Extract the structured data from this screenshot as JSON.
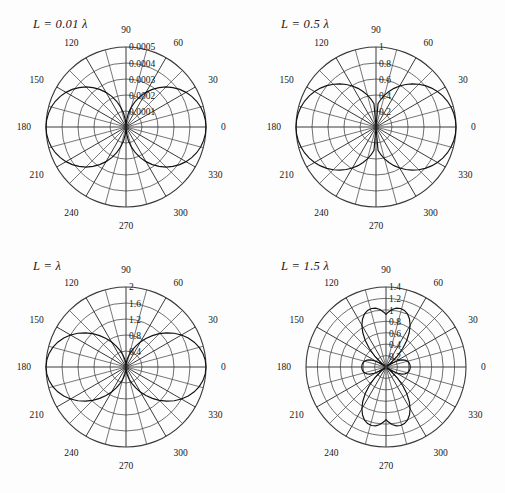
{
  "figure": {
    "background_color": "#fdfdfd",
    "line_color": "#3a3a3a",
    "pattern_color": "#111111"
  },
  "chart_data": [
    {
      "type": "line",
      "plot_style": "polar",
      "title": "L = 0.01 λ",
      "title_parts": {
        "symbol": "L",
        "equals": "=",
        "value": "0.01",
        "unit": "λ"
      },
      "xlabel": "",
      "ylabel": "",
      "grid": true,
      "legend": "none",
      "angle_unit": "degrees",
      "angle_ticks": [
        0,
        30,
        60,
        90,
        120,
        150,
        180,
        210,
        240,
        270,
        300,
        330
      ],
      "angle_tick_labels": [
        "0",
        "30",
        "60",
        "90",
        "120",
        "150",
        "180",
        "210",
        "240",
        "270",
        "300",
        "330"
      ],
      "angle_minor_step": 15,
      "radial_ticks": [
        0.0001,
        0.0002,
        0.0003,
        0.0004,
        0.0005
      ],
      "radial_tick_labels": [
        "0.0001",
        "0.0002",
        "0.0003",
        "0.0004",
        "0.0005"
      ],
      "rlim": [
        0,
        0.0005
      ],
      "series": [
        {
          "name": "|E| pattern",
          "description": "Figure-eight dipole pattern, maxima along 0 and 180 degrees",
          "theta": [
            0,
            5,
            10,
            15,
            20,
            25,
            30,
            35,
            40,
            45,
            50,
            55,
            60,
            65,
            70,
            75,
            80,
            85,
            90,
            95,
            100,
            105,
            110,
            115,
            120,
            125,
            130,
            135,
            140,
            145,
            150,
            155,
            160,
            165,
            170,
            175,
            180,
            185,
            190,
            195,
            200,
            205,
            210,
            215,
            220,
            225,
            230,
            235,
            240,
            245,
            250,
            255,
            260,
            265,
            270,
            275,
            280,
            285,
            290,
            295,
            300,
            305,
            310,
            315,
            320,
            325,
            330,
            335,
            340,
            345,
            350,
            355,
            360
          ],
          "r": [
            0.0005,
            0.000498,
            0.000492,
            0.000483,
            0.00047,
            0.000453,
            0.000433,
            0.00041,
            0.000383,
            0.000354,
            0.000321,
            0.000287,
            0.00025,
            0.000211,
            0.000171,
            0.000129,
            8.68e-05,
            4.35e-05,
            0.0,
            4.35e-05,
            8.68e-05,
            0.000129,
            0.000171,
            0.000211,
            0.00025,
            0.000287,
            0.000321,
            0.000354,
            0.000383,
            0.00041,
            0.000433,
            0.000453,
            0.00047,
            0.000483,
            0.000492,
            0.000498,
            0.0005,
            0.000498,
            0.000492,
            0.000483,
            0.00047,
            0.000453,
            0.000433,
            0.00041,
            0.000383,
            0.000354,
            0.000321,
            0.000287,
            0.00025,
            0.000211,
            0.000171,
            0.000129,
            8.68e-05,
            4.35e-05,
            0.0,
            4.35e-05,
            8.68e-05,
            0.000129,
            0.000171,
            0.000211,
            0.00025,
            0.000287,
            0.000321,
            0.000354,
            0.000383,
            0.00041,
            0.000433,
            0.000453,
            0.00047,
            0.000483,
            0.000492,
            0.000498,
            0.0005
          ]
        }
      ]
    },
    {
      "type": "line",
      "plot_style": "polar",
      "title": "L = 0.5 λ",
      "title_parts": {
        "symbol": "L",
        "equals": "=",
        "value": "0.5",
        "unit": "λ"
      },
      "xlabel": "",
      "ylabel": "",
      "grid": true,
      "legend": "none",
      "angle_unit": "degrees",
      "angle_ticks": [
        0,
        30,
        60,
        90,
        120,
        150,
        180,
        210,
        240,
        270,
        300,
        330
      ],
      "angle_tick_labels": [
        "0",
        "30",
        "60",
        "90",
        "120",
        "150",
        "180",
        "210",
        "240",
        "270",
        "300",
        "330"
      ],
      "angle_minor_step": 15,
      "radial_ticks": [
        0.2,
        0.4,
        0.6,
        0.8,
        1
      ],
      "radial_tick_labels": [
        "0.2",
        "0.4",
        "0.6",
        "0.8",
        "1"
      ],
      "rlim": [
        0,
        1
      ],
      "series": [
        {
          "name": "|E| pattern",
          "description": "Half-wave dipole figure-eight, maxima along 0 and 180 degrees",
          "theta": [
            0,
            5,
            10,
            15,
            20,
            25,
            30,
            35,
            40,
            45,
            50,
            55,
            60,
            65,
            70,
            75,
            80,
            85,
            90,
            95,
            100,
            105,
            110,
            115,
            120,
            125,
            130,
            135,
            140,
            145,
            150,
            155,
            160,
            165,
            170,
            175,
            180,
            185,
            190,
            195,
            200,
            205,
            210,
            215,
            220,
            225,
            230,
            235,
            240,
            245,
            250,
            255,
            260,
            265,
            270,
            275,
            280,
            285,
            290,
            295,
            300,
            305,
            310,
            315,
            320,
            325,
            330,
            335,
            340,
            345,
            350,
            355,
            360
          ],
          "r": [
            1.0,
            0.9967,
            0.987,
            0.9709,
            0.9486,
            0.9204,
            0.8866,
            0.8476,
            0.8038,
            0.7558,
            0.7041,
            0.6493,
            0.5921,
            0.5331,
            0.4729,
            0.4122,
            0.3516,
            0.2917,
            0.0,
            0.2917,
            0.3516,
            0.4122,
            0.4729,
            0.5331,
            0.5921,
            0.6493,
            0.7041,
            0.7558,
            0.8038,
            0.8476,
            0.8866,
            0.9204,
            0.9486,
            0.9709,
            0.987,
            0.9967,
            1.0,
            0.9967,
            0.987,
            0.9709,
            0.9486,
            0.9204,
            0.8866,
            0.8476,
            0.8038,
            0.7558,
            0.7041,
            0.6493,
            0.5921,
            0.5331,
            0.4729,
            0.4122,
            0.3516,
            0.2917,
            0.0,
            0.2917,
            0.3516,
            0.4122,
            0.4729,
            0.5331,
            0.5921,
            0.6493,
            0.7041,
            0.7558,
            0.8038,
            0.8476,
            0.8866,
            0.9204,
            0.9486,
            0.9709,
            0.987,
            0.9967,
            1.0
          ]
        }
      ]
    },
    {
      "type": "line",
      "plot_style": "polar",
      "title": "L = λ",
      "title_parts": {
        "symbol": "L",
        "equals": "=",
        "value": "",
        "unit": "λ"
      },
      "xlabel": "",
      "ylabel": "",
      "grid": true,
      "legend": "none",
      "angle_unit": "degrees",
      "angle_ticks": [
        0,
        30,
        60,
        90,
        120,
        150,
        180,
        210,
        240,
        270,
        300,
        330
      ],
      "angle_tick_labels": [
        "0",
        "30",
        "60",
        "90",
        "120",
        "150",
        "180",
        "210",
        "240",
        "270",
        "300",
        "330"
      ],
      "angle_minor_step": 15,
      "radial_ticks": [
        0.4,
        0.8,
        1.2,
        1.6,
        2
      ],
      "radial_tick_labels": [
        "0.4",
        "0.8",
        "1.2",
        "1.6",
        "2"
      ],
      "rlim": [
        0,
        2
      ],
      "series": [
        {
          "name": "|E| pattern",
          "description": "Full-wave dipole, broad figure-eight with peak 2.0 along 0 and 180 degrees",
          "theta": [
            0,
            5,
            10,
            15,
            20,
            25,
            30,
            35,
            40,
            45,
            50,
            55,
            60,
            65,
            70,
            75,
            80,
            85,
            90,
            95,
            100,
            105,
            110,
            115,
            120,
            125,
            130,
            135,
            140,
            145,
            150,
            155,
            160,
            165,
            170,
            175,
            180,
            185,
            190,
            195,
            200,
            205,
            210,
            215,
            220,
            225,
            230,
            235,
            240,
            245,
            250,
            255,
            260,
            265,
            270,
            275,
            280,
            285,
            290,
            295,
            300,
            305,
            310,
            315,
            320,
            325,
            330,
            335,
            340,
            345,
            350,
            355,
            360
          ],
          "r": [
            2.0,
            1.988,
            1.953,
            1.895,
            1.816,
            1.717,
            1.601,
            1.47,
            1.328,
            1.178,
            1.024,
            0.8699,
            0.7196,
            0.5763,
            0.4432,
            0.3232,
            0.2188,
            0.1322,
            0.0,
            0.1322,
            0.2188,
            0.3232,
            0.4432,
            0.5763,
            0.7196,
            0.8699,
            1.024,
            1.178,
            1.328,
            1.47,
            1.601,
            1.717,
            1.816,
            1.895,
            1.953,
            1.988,
            2.0,
            1.988,
            1.953,
            1.895,
            1.816,
            1.717,
            1.601,
            1.47,
            1.328,
            1.178,
            1.024,
            0.8699,
            0.7196,
            0.5763,
            0.4432,
            0.3232,
            0.2188,
            0.1322,
            0.0,
            0.1322,
            0.2188,
            0.3232,
            0.4432,
            0.5763,
            0.7196,
            0.8699,
            1.024,
            1.178,
            1.328,
            1.47,
            1.601,
            1.717,
            1.816,
            1.895,
            1.953,
            1.988,
            2.0
          ]
        }
      ]
    },
    {
      "type": "line",
      "plot_style": "polar",
      "title": "L = 1.5 λ",
      "title_parts": {
        "symbol": "L",
        "equals": "=",
        "value": "1.5",
        "unit": "λ"
      },
      "xlabel": "",
      "ylabel": "",
      "grid": true,
      "legend": "none",
      "angle_unit": "degrees",
      "angle_ticks": [
        0,
        30,
        60,
        90,
        120,
        150,
        180,
        210,
        240,
        270,
        300,
        330
      ],
      "angle_tick_labels": [
        "0",
        "30",
        "60",
        "90",
        "120",
        "150",
        "180",
        "210",
        "240",
        "270",
        "300",
        "330"
      ],
      "angle_minor_step": 15,
      "radial_ticks": [
        0.2,
        0.4,
        0.6,
        0.8,
        1,
        1.2,
        1.4
      ],
      "radial_tick_labels": [
        "0.2",
        "0.4",
        "0.6",
        "0.8",
        "1",
        "1.2",
        "1.4"
      ],
      "rlim": [
        0,
        1.4
      ],
      "series": [
        {
          "name": "|E| pattern",
          "description": "1.5-wavelength dipole: four main lobes near 45, 135, 225, 315 degrees plus small side lobes along the 0-180 degree axis",
          "theta": [
            0,
            4,
            8,
            12,
            16,
            20,
            24,
            28,
            32,
            36,
            40,
            44,
            48,
            52,
            56,
            60,
            64,
            68,
            72,
            76,
            80,
            84,
            88,
            90,
            92,
            96,
            100,
            104,
            108,
            112,
            116,
            120,
            124,
            128,
            132,
            136,
            140,
            144,
            148,
            152,
            156,
            160,
            164,
            168,
            172,
            176,
            180,
            184,
            188,
            192,
            196,
            200,
            204,
            208,
            212,
            216,
            220,
            224,
            228,
            232,
            236,
            240,
            244,
            248,
            252,
            256,
            260,
            264,
            268,
            270,
            272,
            276,
            280,
            284,
            288,
            292,
            296,
            300,
            304,
            308,
            312,
            316,
            320,
            324,
            328,
            332,
            336,
            340,
            344,
            348,
            352,
            356,
            360
          ],
          "r": [
            0.4244,
            0.4226,
            0.4166,
            0.4047,
            0.3843,
            0.3519,
            0.3033,
            0.2341,
            0.1405,
            0.0211,
            0.1187,
            0.2747,
            0.4358,
            0.5898,
            0.7278,
            0.8443,
            0.9362,
            1.0021,
            1.0418,
            1.0558,
            1.045,
            1.0108,
            0.9549,
            0.9194,
            0.9549,
            1.0108,
            1.045,
            1.0558,
            1.0418,
            1.0021,
            0.9362,
            0.8443,
            0.7278,
            0.5898,
            0.4358,
            0.2747,
            0.1187,
            0.0211,
            0.1405,
            0.2341,
            0.3033,
            0.3519,
            0.3843,
            0.4047,
            0.4166,
            0.4226,
            0.4244,
            0.4226,
            0.4166,
            0.4047,
            0.3843,
            0.3519,
            0.3033,
            0.2341,
            0.1405,
            0.0211,
            0.1187,
            0.2747,
            0.4358,
            0.5898,
            0.7278,
            0.8443,
            0.9362,
            1.0021,
            1.0418,
            1.0558,
            1.045,
            1.0108,
            0.9549,
            0.9194,
            0.9549,
            1.0108,
            1.045,
            1.0558,
            1.0418,
            1.0021,
            0.9362,
            0.8443,
            0.7278,
            0.5898,
            0.4358,
            0.2747,
            0.1187,
            0.0211,
            0.1405,
            0.2341,
            0.3033,
            0.3519,
            0.3843,
            0.4047,
            0.4166,
            0.4226,
            0.4244
          ]
        }
      ]
    }
  ]
}
